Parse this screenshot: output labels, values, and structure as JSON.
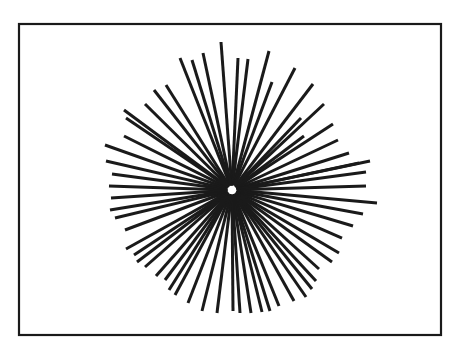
{
  "diagram": {
    "type": "radial-starburst",
    "background": "#ffffff",
    "stroke_color": "#1a1a1a",
    "frame": {
      "x": 19,
      "y": 24,
      "width": 422,
      "height": 311,
      "stroke_width": 2.2
    },
    "center": {
      "x": 232,
      "y": 190
    },
    "hub_gap_radius": 7,
    "line_width": 3,
    "rays": [
      [
        221,
        42
      ],
      [
        238,
        58
      ],
      [
        248,
        59
      ],
      [
        269,
        51
      ],
      [
        272,
        82
      ],
      [
        295,
        68
      ],
      [
        313,
        84
      ],
      [
        324,
        104
      ],
      [
        301,
        118
      ],
      [
        333,
        124
      ],
      [
        304,
        136
      ],
      [
        338,
        140
      ],
      [
        349,
        153
      ],
      [
        359,
        163
      ],
      [
        370,
        161
      ],
      [
        366,
        172
      ],
      [
        366,
        186
      ],
      [
        377,
        203
      ],
      [
        363,
        214
      ],
      [
        353,
        226
      ],
      [
        342,
        238
      ],
      [
        339,
        253
      ],
      [
        332,
        262
      ],
      [
        319,
        269
      ],
      [
        316,
        281
      ],
      [
        312,
        289
      ],
      [
        306,
        297
      ],
      [
        294,
        301
      ],
      [
        279,
        306
      ],
      [
        270,
        311
      ],
      [
        262,
        312
      ],
      [
        251,
        313
      ],
      [
        240,
        313
      ],
      [
        233,
        311
      ],
      [
        217,
        313
      ],
      [
        202,
        311
      ],
      [
        188,
        303
      ],
      [
        175,
        295
      ],
      [
        169,
        290
      ],
      [
        165,
        280
      ],
      [
        156,
        276
      ],
      [
        145,
        267
      ],
      [
        137,
        262
      ],
      [
        134,
        255
      ],
      [
        126,
        249
      ],
      [
        125,
        230
      ],
      [
        115,
        218
      ],
      [
        110,
        210
      ],
      [
        111,
        198
      ],
      [
        109,
        186
      ],
      [
        112,
        174
      ],
      [
        106,
        161
      ],
      [
        105,
        145
      ],
      [
        124,
        136
      ],
      [
        126,
        118
      ],
      [
        124,
        110
      ],
      [
        145,
        104
      ],
      [
        154,
        90
      ],
      [
        166,
        85
      ],
      [
        180,
        58
      ],
      [
        192,
        60
      ],
      [
        203,
        53
      ]
    ]
  }
}
